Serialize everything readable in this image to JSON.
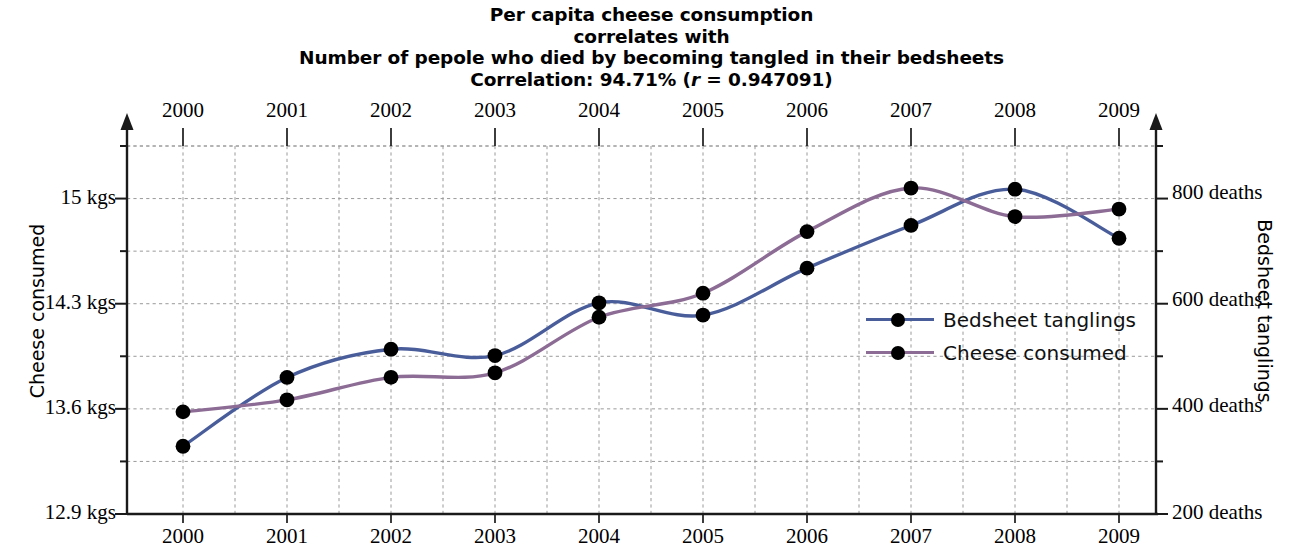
{
  "title": {
    "line1": "Per capita cheese consumption",
    "line2": "correlates with",
    "line3": "Number of pepole who died by becoming tangled in their bedsheets",
    "correlation_prefix": "Correlation: 94.71% (",
    "correlation_r_symbol": "r",
    "correlation_suffix": " = 0.947091)"
  },
  "axes": {
    "left_title": "Cheese consumed",
    "right_title": "Bedsheet tanglings",
    "left_ticks": [
      "15 kgs",
      "14.3 kgs",
      "13.6 kgs",
      "12.9 kgs"
    ],
    "right_ticks": [
      "800 deaths",
      "600 deaths",
      "400 deaths",
      "200 deaths"
    ],
    "top_years": [
      "2000",
      "2001",
      "2002",
      "2003",
      "2004",
      "2005",
      "2006",
      "2007",
      "2008",
      "2009"
    ],
    "bottom_years": [
      "2000",
      "2001",
      "2002",
      "2003",
      "2004",
      "2005",
      "2006",
      "2007",
      "2008",
      "2009"
    ]
  },
  "legend": {
    "items": [
      {
        "label": "Bedsheet tanglings",
        "color": "#4a5d9b"
      },
      {
        "label": "Cheese consumed",
        "color": "#8c6b94"
      }
    ]
  },
  "colors": {
    "bedsheet_line": "#4a5d9b",
    "cheese_line": "#8c6b94",
    "marker": "#000000",
    "axis": "#1a1a1a",
    "gridline": "#9a9a9a",
    "background": "#ffffff"
  },
  "chart_data": {
    "type": "line",
    "title": "Per capita cheese consumption correlates with Number of pepole who died by becoming tangled in their bedsheets",
    "subtitle": "Correlation: 94.71% (r = 0.947091)",
    "x": [
      2000,
      2001,
      2002,
      2003,
      2004,
      2005,
      2006,
      2007,
      2008,
      2009
    ],
    "xlabel": "",
    "grid": true,
    "legend_position": "center-right",
    "series": [
      {
        "name": "Cheese consumed",
        "axis": "left",
        "unit": "kgs",
        "color": "#8c6b94",
        "values": [
          13.58,
          13.66,
          13.81,
          13.84,
          14.21,
          14.37,
          14.78,
          15.07,
          14.88,
          14.93
        ],
        "ylabel": "Cheese consumed",
        "ytick_values": [
          15,
          14.3,
          13.6,
          12.9
        ],
        "ylim": [
          12.9,
          15.35
        ]
      },
      {
        "name": "Bedsheet tanglings",
        "axis": "right",
        "unit": "deaths",
        "color": "#4a5d9b",
        "values": [
          327,
          456,
          509,
          497,
          596,
          573,
          661,
          741,
          809,
          717
        ],
        "ylabel": "Bedsheet tanglings",
        "ytick_values": [
          800,
          600,
          400,
          200
        ],
        "ylim": [
          200,
          890
        ]
      }
    ]
  }
}
